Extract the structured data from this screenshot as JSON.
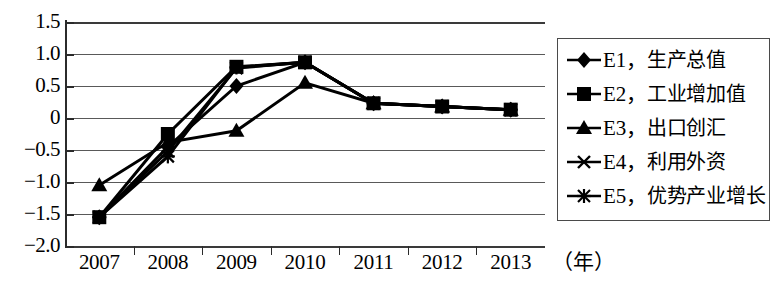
{
  "chart_data": {
    "type": "line",
    "title": "",
    "xlabel": "(年)",
    "ylabel": "",
    "categories": [
      "2007",
      "2008",
      "2009",
      "2010",
      "2011",
      "2012",
      "2013"
    ],
    "ylim": [
      -2.0,
      1.5
    ],
    "yticks": [
      "1.5",
      "1.0",
      "0.5",
      "0",
      "-0.5",
      "-1.0",
      "-1.5",
      "-2.0"
    ],
    "ytick_values": [
      1.5,
      1.0,
      0.5,
      0,
      -0.5,
      -1.0,
      -1.5,
      -2.0
    ],
    "grid": true,
    "legend_position": "right",
    "series": [
      {
        "name": "E1",
        "label": "生产总值",
        "marker": "diamond",
        "values": [
          -1.55,
          -0.45,
          0.5,
          0.87,
          0.23,
          0.18,
          0.13
        ]
      },
      {
        "name": "E2",
        "label": "工业增加值",
        "marker": "square",
        "values": [
          -1.55,
          -0.25,
          0.8,
          0.87,
          0.23,
          0.18,
          0.13
        ]
      },
      {
        "name": "E3",
        "label": "出口创汇",
        "marker": "triangle",
        "values": [
          -1.05,
          -0.38,
          -0.2,
          0.55,
          0.23,
          0.18,
          0.13
        ]
      },
      {
        "name": "E4",
        "label": "利用外资",
        "marker": "x",
        "values": [
          -1.55,
          -0.52,
          0.78,
          0.87,
          0.23,
          0.18,
          0.13
        ]
      },
      {
        "name": "E5",
        "label": "优势产业增长",
        "marker": "asterisk",
        "values": [
          -1.55,
          -0.6,
          0.79,
          0.87,
          0.23,
          0.18,
          0.13
        ]
      }
    ]
  },
  "legend": {
    "entries": [
      {
        "code": "E1，",
        "text": "生产总值",
        "marker": "diamond-marker-icon"
      },
      {
        "code": "E2，",
        "text": "工业增加值",
        "marker": "square-marker-icon"
      },
      {
        "code": "E3，",
        "text": "出口创汇",
        "marker": "triangle-marker-icon"
      },
      {
        "code": "E4，",
        "text": "利用外资",
        "marker": "x-marker-icon"
      },
      {
        "code": "E5，",
        "text": "优势产业增长",
        "marker": "asterisk-marker-icon"
      }
    ]
  },
  "axis": {
    "x_unit": "（年）"
  }
}
